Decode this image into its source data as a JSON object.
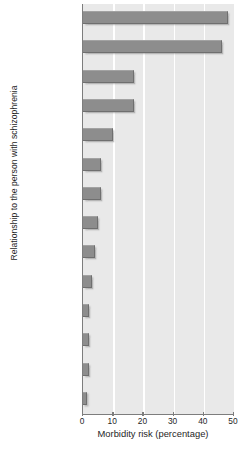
{
  "figure": {
    "caption": "Figure 11.5",
    "corner_mark_icon": "corner-bracket-icon"
  },
  "chart_data": {
    "type": "bar",
    "orientation": "horizontal",
    "title": "",
    "xlabel": "Morbidity risk (percentage)",
    "ylabel": "Relationship to the person with schizophrenia",
    "xlim": [
      0,
      50
    ],
    "xticks": [
      0,
      10,
      20,
      30,
      40,
      50
    ],
    "xtick_labels": [
      "0",
      "10",
      "20",
      "30",
      "40",
      "50"
    ],
    "grid": "vertical-white-gridlines",
    "legend": "none",
    "bar_color": "#8d8d8d",
    "plot_background": "#e9e9e9",
    "axis_color": "#7d7d7d",
    "categories": [
      "MZ twins",
      "Child of two affected parents",
      "DZ twins",
      "Child of one affected parent",
      "Sibling",
      "Parents",
      "Half-sibling",
      "Grandchild",
      "Niece and nephew",
      "Cousin",
      "Uncle and aunt",
      "Grandparent",
      "Spouse",
      "No relationship"
    ],
    "category_lines": [
      [
        "MZ twins"
      ],
      [
        "Child of two",
        "affected parents"
      ],
      [
        "DZ twins"
      ],
      [
        "Child of one",
        "affected parent"
      ],
      [
        "Sibling"
      ],
      [
        "Parents"
      ],
      [
        "Half-sibling"
      ],
      [
        "Grandchild"
      ],
      [
        "Niece and",
        "nephew"
      ],
      [
        "Cousin"
      ],
      [
        "Uncle and",
        "aunt"
      ],
      [
        "Grandparent"
      ],
      [
        "Spouse"
      ],
      [
        "No relationship"
      ]
    ],
    "values": [
      48,
      46,
      17,
      17,
      10,
      6,
      6,
      5,
      4,
      3,
      2,
      2,
      2,
      1
    ]
  }
}
